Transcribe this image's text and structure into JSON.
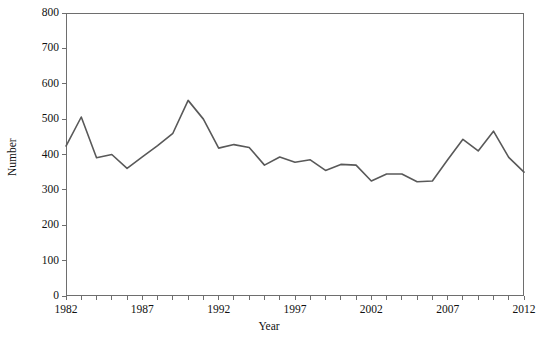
{
  "chart_data": {
    "type": "line",
    "title": "",
    "xlabel": "Year",
    "ylabel": "Number",
    "xlim": [
      1982,
      2012
    ],
    "ylim": [
      0,
      800
    ],
    "grid": false,
    "legend": "none",
    "y_ticks": [
      0,
      100,
      200,
      300,
      400,
      500,
      600,
      700,
      800
    ],
    "y_tick_labels": [
      "0",
      "100",
      "200",
      "300",
      "400",
      "500",
      "600",
      "700",
      "800"
    ],
    "x_ticks": [
      1982,
      1983,
      1984,
      1985,
      1986,
      1987,
      1988,
      1989,
      1990,
      1991,
      1992,
      1993,
      1994,
      1995,
      1996,
      1997,
      1998,
      1999,
      2000,
      2001,
      2002,
      2003,
      2004,
      2005,
      2006,
      2007,
      2008,
      2009,
      2010,
      2011,
      2012
    ],
    "x_major_tick_labels": [
      "1982",
      "1987",
      "1992",
      "1997",
      "2002",
      "2007",
      "2012"
    ],
    "x_major_ticks": [
      1982,
      1987,
      1992,
      1997,
      2002,
      2007,
      2012
    ],
    "series": [
      {
        "name": "Number",
        "color": "#595959",
        "x": [
          1982,
          1983,
          1984,
          1985,
          1986,
          1987,
          1988,
          1989,
          1990,
          1991,
          1992,
          1993,
          1994,
          1995,
          1996,
          1997,
          1998,
          1999,
          2000,
          2001,
          2002,
          2003,
          2004,
          2005,
          2006,
          2007,
          2008,
          2009,
          2010,
          2011,
          2012
        ],
        "values": [
          424,
          506,
          391,
          400,
          361,
          393,
          425,
          460,
          553,
          500,
          418,
          428,
          420,
          370,
          393,
          378,
          385,
          355,
          372,
          370,
          325,
          345,
          345,
          323,
          325,
          385,
          443,
          410,
          466,
          392,
          350
        ]
      }
    ]
  },
  "axes": {
    "y_title": "Number",
    "x_title": "Year"
  },
  "colors": {
    "line": "#595959",
    "frame": "#6e6e6e",
    "text": "#111111",
    "background": "#ffffff"
  }
}
